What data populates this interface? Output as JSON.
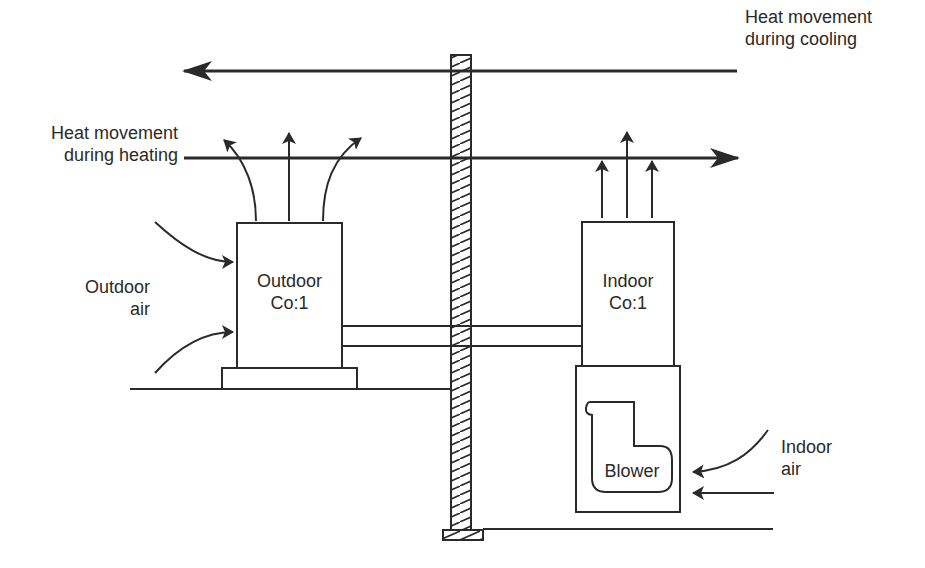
{
  "diagram": {
    "labels": {
      "cooling_line1": "Heat movement",
      "cooling_line2": "during cooling",
      "heating_line1": "Heat movement",
      "heating_line2": "during heating",
      "outdoor_air_line1": "Outdoor",
      "outdoor_air_line2": "air",
      "outdoor_coil_line1": "Outdoor",
      "outdoor_coil_line2": "Co:1",
      "indoor_coil_line1": "Indoor",
      "indoor_coil_line2": "Co:1",
      "blower": "Blower",
      "indoor_air_line1": "Indoor",
      "indoor_air_line2": "air"
    },
    "colors": {
      "line": "#2a2a2a",
      "background": "#ffffff"
    }
  }
}
